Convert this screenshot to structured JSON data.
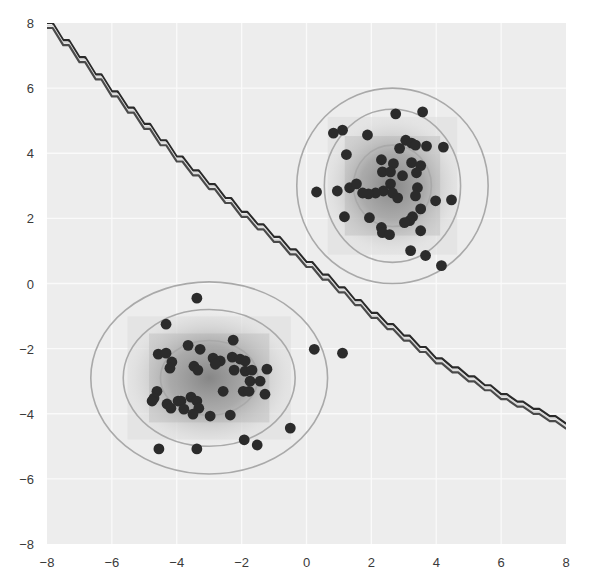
{
  "chart_data": {
    "type": "scatter",
    "title": "",
    "xlabel": "",
    "ylabel": "",
    "xlim": [
      -8,
      8
    ],
    "ylim": [
      -8,
      8
    ],
    "grid": true,
    "legend": null,
    "xticks": [
      -8,
      -6,
      -4,
      -2,
      0,
      2,
      4,
      6,
      8
    ],
    "yticks": [
      -8,
      -6,
      -4,
      -2,
      0,
      2,
      4,
      6,
      8
    ],
    "xtick_labels": [
      "−8",
      "−6",
      "−4",
      "−2",
      "0",
      "2",
      "4",
      "6",
      "8"
    ],
    "ytick_labels": [
      "−8",
      "−6",
      "−4",
      "−2",
      "0",
      "2",
      "4",
      "6",
      "8"
    ],
    "colors": {
      "plot_background": "#ededed",
      "grid": "#fafafa",
      "points": "#2b2b2b",
      "contour": "#a9a9a9",
      "boundary_dark": "#2a2a2a",
      "boundary_light": "#d8d8d8",
      "density": "#6e6e6e"
    },
    "decision_boundary": {
      "description": "curved staircase boundary separating two Gaussian clusters",
      "points": [
        [
          -8,
          8.0
        ],
        [
          -6,
          5.9
        ],
        [
          -4,
          3.9
        ],
        [
          -2,
          2.2
        ],
        [
          0,
          0.66
        ],
        [
          2,
          -0.9
        ],
        [
          4,
          -2.3
        ],
        [
          6,
          -3.4
        ],
        [
          8,
          -4.3
        ]
      ]
    },
    "series": [
      {
        "name": "cluster_upper_right",
        "center": [
          2.65,
          3.0
        ],
        "contours": [
          {
            "level": "inner",
            "rx": 1.2,
            "ry": 1.25
          },
          {
            "level": "middle",
            "rx": 2.1,
            "ry": 2.35
          },
          {
            "level": "outer",
            "rx": 2.95,
            "ry": 3.0
          }
        ],
        "points": [
          [
            2.75,
            5.21
          ],
          [
            3.58,
            5.27
          ],
          [
            0.83,
            4.62
          ],
          [
            1.11,
            4.71
          ],
          [
            1.88,
            4.56
          ],
          [
            3.06,
            4.4
          ],
          [
            3.24,
            4.31
          ],
          [
            2.87,
            4.15
          ],
          [
            3.36,
            4.25
          ],
          [
            3.7,
            4.22
          ],
          [
            4.22,
            4.19
          ],
          [
            1.23,
            3.96
          ],
          [
            2.31,
            3.8
          ],
          [
            2.68,
            3.68
          ],
          [
            3.24,
            3.71
          ],
          [
            3.52,
            3.62
          ],
          [
            2.34,
            3.43
          ],
          [
            2.59,
            3.43
          ],
          [
            3.39,
            3.4
          ],
          [
            2.96,
            3.31
          ],
          [
            2.59,
            3.06
          ],
          [
            2.37,
            2.84
          ],
          [
            2.13,
            2.78
          ],
          [
            2.65,
            2.78
          ],
          [
            2.81,
            2.63
          ],
          [
            3.42,
            2.94
          ],
          [
            1.33,
            2.94
          ],
          [
            1.54,
            3.06
          ],
          [
            0.95,
            2.84
          ],
          [
            0.31,
            2.81
          ],
          [
            1.91,
            2.75
          ],
          [
            1.73,
            2.78
          ],
          [
            3.36,
            2.69
          ],
          [
            3.98,
            2.54
          ],
          [
            4.47,
            2.57
          ],
          [
            1.17,
            2.05
          ],
          [
            1.94,
            2.02
          ],
          [
            3.52,
            2.29
          ],
          [
            3.27,
            2.05
          ],
          [
            3.18,
            1.93
          ],
          [
            3.02,
            1.87
          ],
          [
            2.31,
            1.72
          ],
          [
            2.34,
            1.56
          ],
          [
            2.56,
            1.5
          ],
          [
            3.52,
            1.62
          ],
          [
            3.21,
            1.01
          ],
          [
            3.67,
            0.86
          ],
          [
            4.16,
            0.55
          ]
        ]
      },
      {
        "name": "cluster_lower_left",
        "center": [
          -3.0,
          -2.9
        ],
        "contours": [
          {
            "level": "inner",
            "rx": 1.5,
            "ry": 1.15
          },
          {
            "level": "middle",
            "rx": 2.65,
            "ry": 2.1
          },
          {
            "level": "outer",
            "rx": 3.65,
            "ry": 2.95
          }
        ],
        "points": [
          [
            -3.38,
            -0.45
          ],
          [
            -4.33,
            -1.25
          ],
          [
            -3.65,
            -1.9
          ],
          [
            -4.57,
            -2.17
          ],
          [
            -4.33,
            -2.14
          ],
          [
            -3.28,
            -2.02
          ],
          [
            -2.26,
            -1.74
          ],
          [
            -4.15,
            -2.41
          ],
          [
            -4.21,
            -2.6
          ],
          [
            -3.47,
            -2.54
          ],
          [
            -3.35,
            -2.66
          ],
          [
            -2.88,
            -2.29
          ],
          [
            -2.66,
            -2.38
          ],
          [
            -2.81,
            -2.48
          ],
          [
            -2.29,
            -2.26
          ],
          [
            -2.05,
            -2.32
          ],
          [
            -2.23,
            -2.66
          ],
          [
            -1.89,
            -2.38
          ],
          [
            -1.89,
            -2.69
          ],
          [
            -1.68,
            -2.66
          ],
          [
            -1.22,
            -2.63
          ],
          [
            -1.74,
            -3.0
          ],
          [
            -1.43,
            -3.0
          ],
          [
            -2.57,
            -3.31
          ],
          [
            -1.95,
            -3.31
          ],
          [
            -1.77,
            -3.31
          ],
          [
            -1.28,
            -3.4
          ],
          [
            -4.61,
            -3.31
          ],
          [
            -4.7,
            -3.52
          ],
          [
            -3.56,
            -3.49
          ],
          [
            -3.87,
            -3.61
          ],
          [
            -4.3,
            -3.7
          ],
          [
            -4.18,
            -3.83
          ],
          [
            -3.96,
            -3.61
          ],
          [
            -3.78,
            -3.86
          ],
          [
            -3.38,
            -3.61
          ],
          [
            -3.32,
            -3.83
          ],
          [
            -4.76,
            -3.61
          ],
          [
            -3.5,
            -4.01
          ],
          [
            -2.97,
            -4.07
          ],
          [
            -2.35,
            -4.04
          ],
          [
            -0.5,
            -4.44
          ],
          [
            -1.92,
            -4.8
          ],
          [
            -1.52,
            -4.96
          ],
          [
            -4.55,
            -5.08
          ],
          [
            -3.38,
            -5.08
          ],
          [
            0.24,
            -2.02
          ],
          [
            1.11,
            -2.14
          ]
        ]
      }
    ]
  }
}
